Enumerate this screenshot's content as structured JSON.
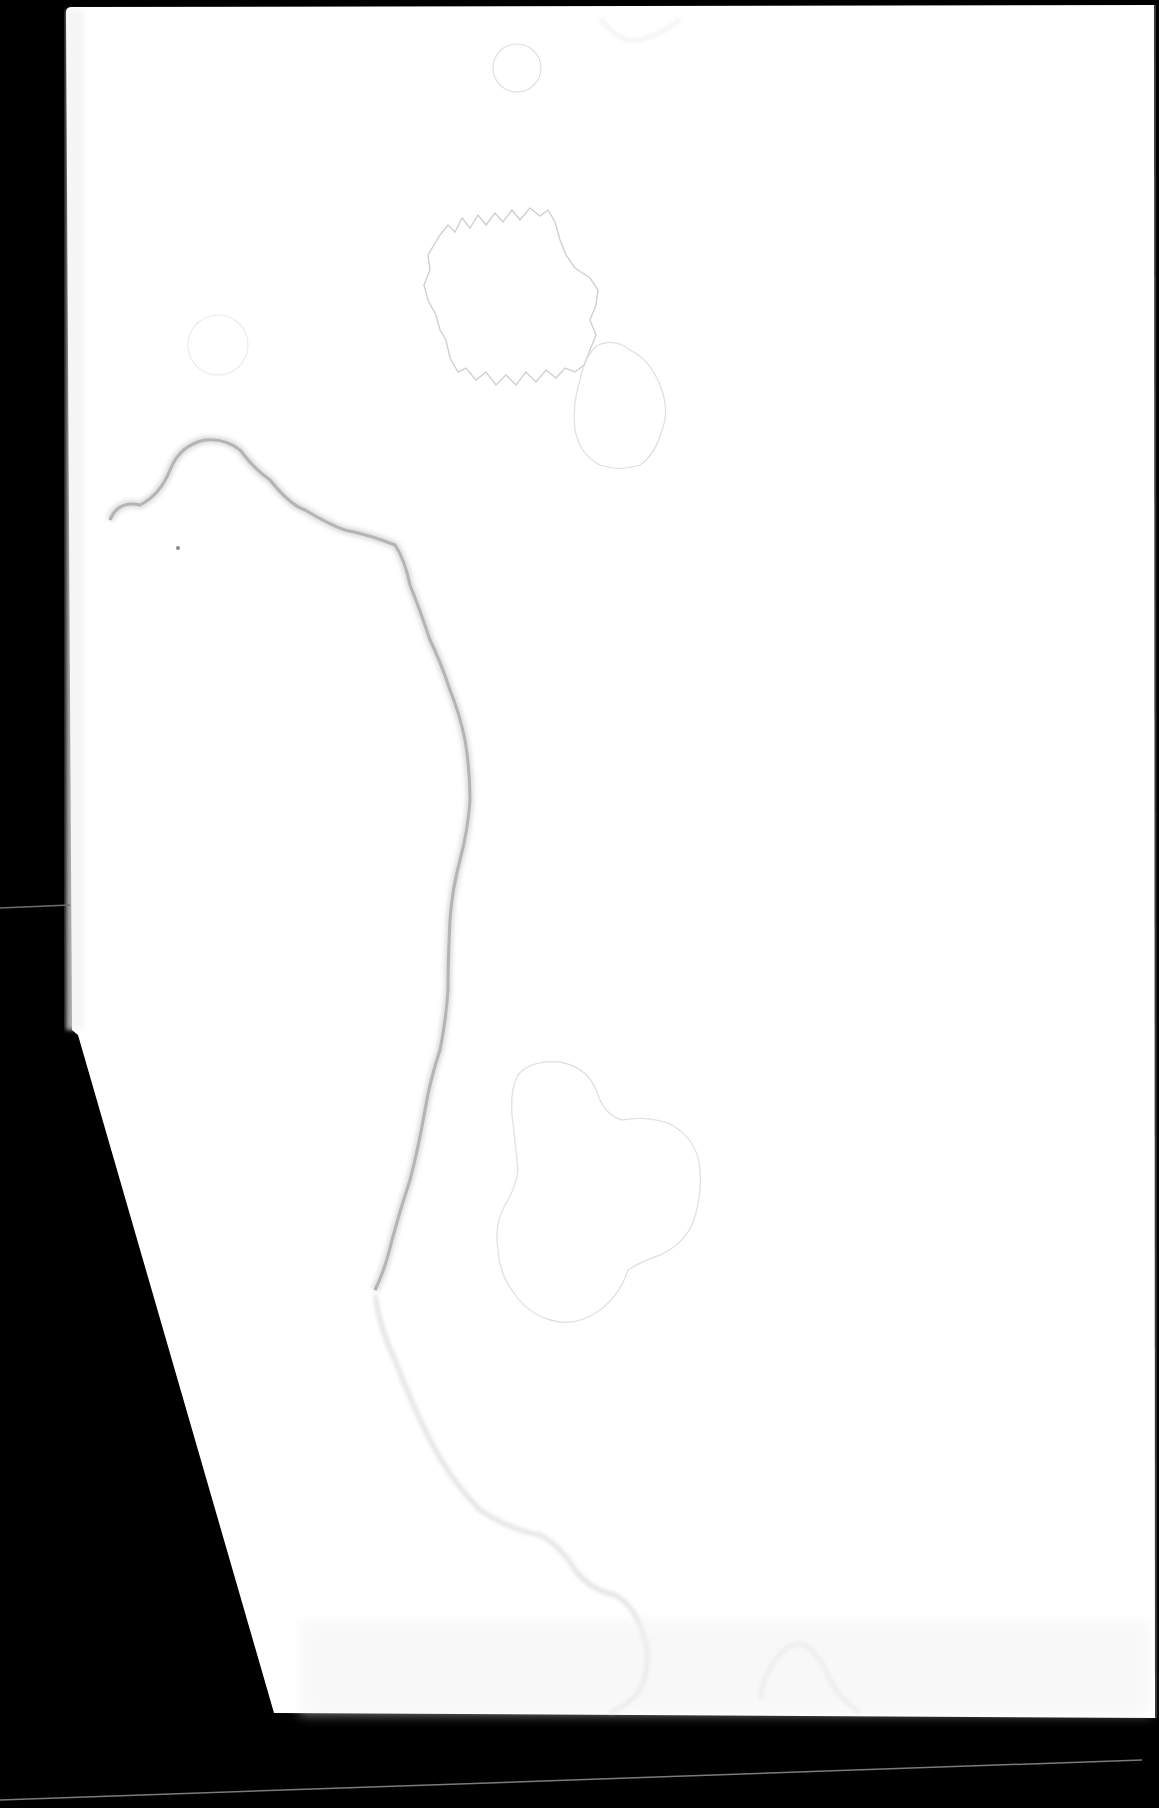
{
  "document": {
    "type": "scanned-blank-page",
    "text_content": "",
    "colors": {
      "background": "#000000",
      "paper": "#ffffff",
      "stain_dark_edge": "#9a9a9a",
      "stain_light_edge": "#d6d6d6",
      "scanner_line": "#7a7a7a"
    }
  }
}
